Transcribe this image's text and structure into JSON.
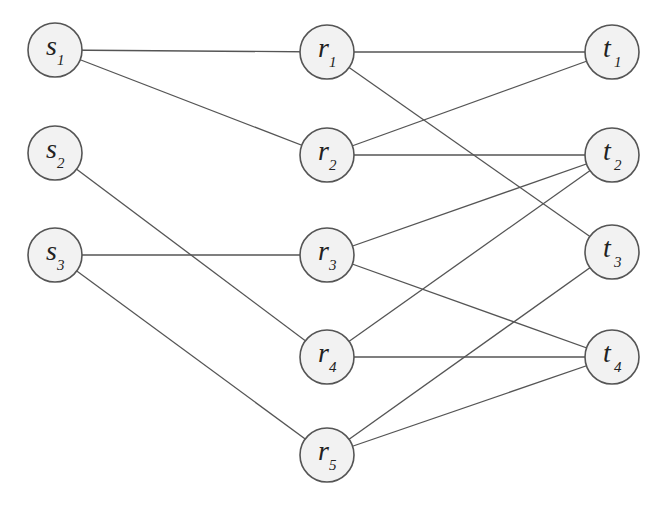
{
  "diagram": {
    "type": "layered-graph",
    "colors": {
      "edge": "#555555",
      "node_fill": "#f2f2f2",
      "node_stroke": "#555555",
      "text": "#222222"
    },
    "node_radius": 27,
    "nodes": [
      {
        "id": "s1",
        "letter": "s",
        "sub": "1",
        "x": 55,
        "y": 50
      },
      {
        "id": "s2",
        "letter": "s",
        "sub": "2",
        "x": 55,
        "y": 153
      },
      {
        "id": "s3",
        "letter": "s",
        "sub": "3",
        "x": 55,
        "y": 255
      },
      {
        "id": "r1",
        "letter": "r",
        "sub": "1",
        "x": 327,
        "y": 52
      },
      {
        "id": "r2",
        "letter": "r",
        "sub": "2",
        "x": 327,
        "y": 155
      },
      {
        "id": "r3",
        "letter": "r",
        "sub": "3",
        "x": 327,
        "y": 255
      },
      {
        "id": "r4",
        "letter": "r",
        "sub": "4",
        "x": 327,
        "y": 357
      },
      {
        "id": "r5",
        "letter": "r",
        "sub": "5",
        "x": 327,
        "y": 455
      },
      {
        "id": "t1",
        "letter": "t",
        "sub": "1",
        "x": 612,
        "y": 52
      },
      {
        "id": "t2",
        "letter": "t",
        "sub": "2",
        "x": 612,
        "y": 155
      },
      {
        "id": "t3",
        "letter": "t",
        "sub": "3",
        "x": 612,
        "y": 252
      },
      {
        "id": "t4",
        "letter": "t",
        "sub": "4",
        "x": 612,
        "y": 357
      }
    ],
    "edges": [
      [
        "s1",
        "r1"
      ],
      [
        "s1",
        "r2"
      ],
      [
        "s2",
        "r4"
      ],
      [
        "s3",
        "r3"
      ],
      [
        "s3",
        "r5"
      ],
      [
        "r1",
        "t1"
      ],
      [
        "r1",
        "t3"
      ],
      [
        "r2",
        "t1"
      ],
      [
        "r2",
        "t2"
      ],
      [
        "r3",
        "t2"
      ],
      [
        "r3",
        "t4"
      ],
      [
        "r4",
        "t2"
      ],
      [
        "r4",
        "t4"
      ],
      [
        "r5",
        "t3"
      ],
      [
        "r5",
        "t4"
      ]
    ]
  }
}
